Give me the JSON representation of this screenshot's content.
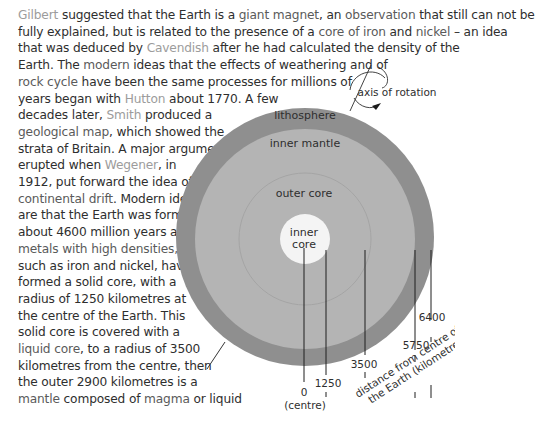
{
  "text": {
    "lines": [
      [
        {
          "t": "Gilbert",
          "s": "name"
        },
        {
          "t": " suggested that the Earth is a ",
          "s": "plain"
        },
        {
          "t": "giant magnet",
          "s": "term"
        },
        {
          "t": ", an ",
          "s": "plain"
        },
        {
          "t": "observation",
          "s": "term"
        },
        {
          "t": " that still can not be",
          "s": "plain"
        }
      ],
      [
        {
          "t": "fully explained, but is related to the presence of a ",
          "s": "plain"
        },
        {
          "t": "core of",
          "s": "term"
        },
        {
          "t": " ",
          "s": "plain"
        },
        {
          "t": "iron",
          "s": "term"
        },
        {
          "t": " and ",
          "s": "plain"
        },
        {
          "t": "nickel",
          "s": "term"
        },
        {
          "t": " – an idea",
          "s": "plain"
        }
      ],
      [
        {
          "t": "that was deduced by ",
          "s": "plain"
        },
        {
          "t": "Cavendish",
          "s": "name"
        },
        {
          "t": " after he had calculated the density of the",
          "s": "plain"
        }
      ],
      [
        {
          "t": "Earth. The ",
          "s": "plain"
        },
        {
          "t": "modern",
          "s": "term"
        },
        {
          "t": " ideas that the effects of weathering and of",
          "s": "plain"
        }
      ],
      [
        {
          "t": "rock cycle",
          "s": "term"
        },
        {
          "t": " have been the same processes for millions of",
          "s": "plain"
        }
      ],
      [
        {
          "t": "years began with ",
          "s": "plain"
        },
        {
          "t": "Hutton",
          "s": "name"
        },
        {
          "t": " about 1770. A few",
          "s": "plain"
        }
      ],
      [
        {
          "t": "decades later, ",
          "s": "plain"
        },
        {
          "t": "Smith",
          "s": "name"
        },
        {
          "t": " produced a",
          "s": "plain"
        }
      ],
      [
        {
          "t": "geological map",
          "s": "term"
        },
        {
          "t": ", which showed the",
          "s": "plain"
        }
      ],
      [
        {
          "t": "strata of Britain. A major argument",
          "s": "plain"
        }
      ],
      [
        {
          "t": "erupted when ",
          "s": "plain"
        },
        {
          "t": "Wegener",
          "s": "name"
        },
        {
          "t": ", in",
          "s": "plain"
        }
      ],
      [
        {
          "t": "1912, put forward the idea of",
          "s": "plain"
        }
      ],
      [
        {
          "t": "continental drift",
          "s": "term"
        },
        {
          "t": ". Modern ideas",
          "s": "plain"
        }
      ],
      [
        {
          "t": "are that the Earth was formed",
          "s": "plain"
        }
      ],
      [
        {
          "t": "about 4600 million years ago;",
          "s": "plain"
        }
      ],
      [
        {
          "t": "metals with high densities,",
          "s": "term"
        }
      ],
      [
        {
          "t": "such as iron and nickel, have",
          "s": "plain"
        }
      ],
      [
        {
          "t": "formed a solid core, with a",
          "s": "plain"
        }
      ],
      [
        {
          "t": "radius of 1250 kilometres at",
          "s": "plain"
        }
      ],
      [
        {
          "t": "the centre of the Earth. This",
          "s": "plain"
        }
      ],
      [
        {
          "t": "solid core is covered with a",
          "s": "plain"
        }
      ],
      [
        {
          "t": "liquid core",
          "s": "term"
        },
        {
          "t": ", to a radius of 3500",
          "s": "plain"
        }
      ],
      [
        {
          "t": "kilometres from the centre, then",
          "s": "plain"
        }
      ],
      [
        {
          "t": "the outer 2900 kilometres is a",
          "s": "plain"
        }
      ],
      [
        {
          "t": "mantle",
          "s": "term"
        },
        {
          "t": " composed of ",
          "s": "plain"
        },
        {
          "t": "magma",
          "s": "term"
        },
        {
          "t": " or liquid",
          "s": "plain"
        }
      ]
    ]
  },
  "diagram": {
    "layers": {
      "lithosphere": "lithosphere",
      "inner_mantle": "inner mantle",
      "outer_core": "outer core",
      "inner_core_line1": "inner",
      "inner_core_line2": "core"
    },
    "axis_label": "axis of rotation",
    "ticks": {
      "t0": "0",
      "t0_sub": "(centre)",
      "t1250": "1250",
      "t3500": "3500",
      "t5750": "5750",
      "t6400": "6400"
    },
    "scale_label_line1": "distance from centre of",
    "scale_label_line2": "the Earth (kilometres)",
    "colors": {
      "lithosphere": "#8f8f8f",
      "mantle": "#b4b4b4",
      "outer_core_line": "#a6a6a6",
      "inner_core": "#f4f4f4"
    }
  }
}
